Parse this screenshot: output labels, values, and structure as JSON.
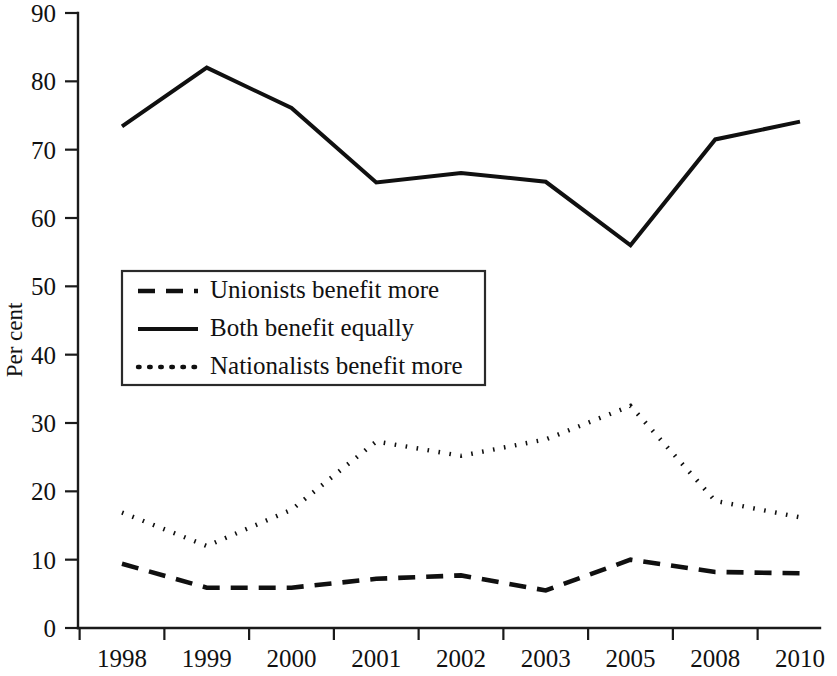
{
  "chart_data": {
    "type": "line",
    "title": "",
    "subtitle": "",
    "xlabel": "",
    "ylabel": "Per cent",
    "categories": [
      "1998",
      "1999",
      "2000",
      "2001",
      "2002",
      "2003",
      "2005",
      "2008",
      "2010"
    ],
    "ylim": [
      0,
      90
    ],
    "yticks": [
      0,
      10,
      20,
      30,
      40,
      50,
      60,
      70,
      80,
      90
    ],
    "ytick_labels": [
      "0",
      "10",
      "20",
      "30",
      "40",
      "50",
      "60",
      "70",
      "80",
      "90"
    ],
    "grid": false,
    "legend_position": "center-left",
    "series": [
      {
        "name": "Unionists benefit more",
        "style": "dashed",
        "color": "#101010",
        "values": [
          9.4,
          5.9,
          5.9,
          7.2,
          7.7,
          5.5,
          10.0,
          8.2,
          8.0
        ]
      },
      {
        "name": "Both benefit equally",
        "style": "solid",
        "color": "#101010",
        "values": [
          73.4,
          82.0,
          76.1,
          65.2,
          66.6,
          65.3,
          56.0,
          71.5,
          74.1
        ]
      },
      {
        "name": "Nationalists benefit more",
        "style": "dotted",
        "color": "#101010",
        "values": [
          16.9,
          12.0,
          17.3,
          27.3,
          25.2,
          27.6,
          32.5,
          18.6,
          16.2
        ]
      }
    ],
    "annotations": []
  }
}
